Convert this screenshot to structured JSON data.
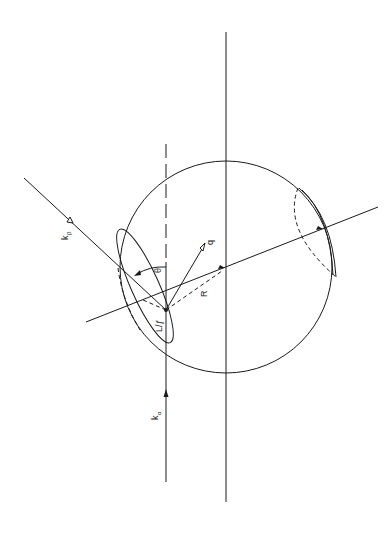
{
  "figure": {
    "type": "physics-geometry-diagram",
    "orientation": "rotated 90deg (scanned page)",
    "background": "#ffffff",
    "ink": "#1a1a1a"
  },
  "labels": {
    "k_beta": {
      "main": "k",
      "sub": "β"
    },
    "k_alpha": {
      "main": "k",
      "sub": "α"
    },
    "q": "q",
    "theta": "θ",
    "R": "R",
    "L_f": "L/ƒ"
  },
  "elements": {
    "sphere": {
      "cx": 226,
      "cy": 267,
      "r": 106
    },
    "vertical_axis": {
      "x": 226,
      "y1": 32,
      "y2": 502
    },
    "incident_beam_line": {
      "x": 166,
      "y1": 144,
      "y2": 482,
      "dashed_above_y": 262
    },
    "outgoing_beam_line": {
      "x1": 24,
      "y1": 178,
      "x2": 166,
      "y2": 310
    },
    "rotation_axis_line": {
      "x1": 86,
      "y1": 322,
      "x2": 378,
      "y2": 207
    },
    "interaction_point": {
      "x": 166,
      "y": 310
    }
  }
}
